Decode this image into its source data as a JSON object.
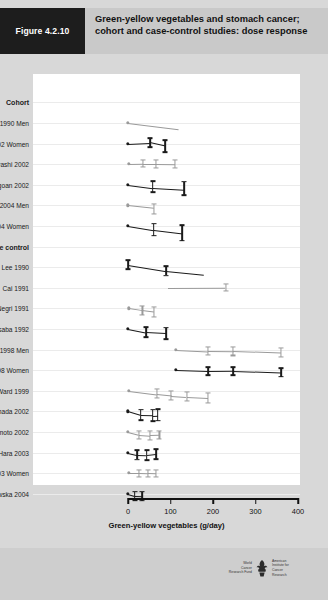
{
  "header": {
    "figure_number": "Figure 4.2.10",
    "title": "Green-yellow vegetables and stomach cancer; cohort and case-control studies: dose response"
  },
  "footer": {
    "logo_left": "World Cancer Research Fund",
    "logo_right": "American Institute for Cancer Research",
    "logo_left_lines": [
      "World",
      "Cancer",
      "Research Fund"
    ],
    "logo_right_lines": [
      "American",
      "Institute for",
      "Cancer Research"
    ]
  },
  "chart_data": {
    "type": "scatter",
    "title": "Green-yellow vegetables and stomach cancer; cohort and case-control studies: dose response",
    "xlabel": "Green-yellow vegetables (g/day)",
    "ylabel": "",
    "xlim": [
      0,
      400
    ],
    "xticks": [
      0,
      100,
      200,
      300,
      400
    ],
    "xtick_labels": [
      "0",
      "100",
      "200",
      "300",
      "400"
    ],
    "grid": true,
    "legend": "none",
    "group_headings": [
      "Cohort",
      "Case control"
    ],
    "colors": {
      "dark": "#1a1a1a",
      "light": "#9a9a9a",
      "grid": "#ebebeb",
      "panel": "#ffffff"
    },
    "rows": [
      {
        "label": "Cohort",
        "heading": true
      },
      {
        "label": "Chyou 1990 Men",
        "color": "light",
        "points": [
          {
            "x": 0,
            "y": 0.0,
            "ref": true
          },
          {
            "x": 118,
            "y": -0.9
          }
        ]
      },
      {
        "label": "Kasum 2002 Women",
        "color": "dark",
        "points": [
          {
            "x": 0,
            "y": 0.0,
            "ref": true
          },
          {
            "x": 52,
            "y": 0.15,
            "lo": -0.5,
            "hi": 0.8
          },
          {
            "x": 88,
            "y": -0.35,
            "lo": -1.2,
            "hi": 0.5
          }
        ]
      },
      {
        "label": "Kobayashi 2002",
        "color": "light",
        "points": [
          {
            "x": 2,
            "y": 0.0,
            "ref": true
          },
          {
            "x": 36,
            "y": 0.05,
            "lo": -0.45,
            "hi": 0.55
          },
          {
            "x": 66,
            "y": 0.05,
            "lo": -0.5,
            "hi": 0.6
          },
          {
            "x": 110,
            "y": 0.0,
            "lo": -0.55,
            "hi": 0.55
          }
        ]
      },
      {
        "label": "Ngoan 2002",
        "color": "dark",
        "points": [
          {
            "x": 0,
            "y": 0.0,
            "ref": true
          },
          {
            "x": 58,
            "y": -0.45,
            "lo": -1.1,
            "hi": 0.55
          },
          {
            "x": 132,
            "y": -0.7,
            "lo": -1.5,
            "hi": 0.45
          }
        ]
      },
      {
        "label": "Khan 2004 Men",
        "color": "light",
        "points": [
          {
            "x": 0,
            "y": 0.0,
            "ref": true
          },
          {
            "x": 62,
            "y": -0.4,
            "lo": -1.3,
            "hi": 0.2
          }
        ]
      },
      {
        "label": "Khan 2004 Women",
        "color": "dark",
        "points": [
          {
            "x": 0,
            "y": 0.0,
            "ref": true
          },
          {
            "x": 60,
            "y": -0.6,
            "lo": -1.4,
            "hi": 0.3
          },
          {
            "x": 128,
            "y": -1.1,
            "lo": -2.1,
            "hi": 0.1
          }
        ]
      },
      {
        "label": "Case control",
        "heading": true
      },
      {
        "label": "Lee 1990",
        "color": "dark",
        "points": [
          {
            "x": 0,
            "y": 0.35,
            "lo": -0.3,
            "hi": 1.0
          },
          {
            "x": 90,
            "y": -0.55,
            "lo": -1.2,
            "hi": 0.1
          },
          {
            "x": 180,
            "y": -1.1
          }
        ]
      },
      {
        "label": "Cai 1991",
        "color": "light",
        "points": [
          {
            "x": 95,
            "y": 0.0
          },
          {
            "x": 230,
            "y": 0.05,
            "lo": -0.45,
            "hi": 0.5
          }
        ]
      },
      {
        "label": "Negri 1991",
        "color": "light",
        "points": [
          {
            "x": 2,
            "y": 0.0,
            "ref": true
          },
          {
            "x": 34,
            "y": -0.3,
            "lo": -0.9,
            "hi": 0.3
          },
          {
            "x": 62,
            "y": -0.5,
            "lo": -1.2,
            "hi": 0.25
          }
        ]
      },
      {
        "label": "Hoshiyama and Sasaba 1992",
        "color": "dark",
        "points": [
          {
            "x": 0,
            "y": 0.0,
            "ref": true
          },
          {
            "x": 42,
            "y": -0.5,
            "lo": -1.2,
            "hi": 0.25
          },
          {
            "x": 90,
            "y": -0.65,
            "lo": -1.5,
            "hi": 0.2
          }
        ]
      },
      {
        "label": "Ji 1998 Men",
        "color": "light",
        "points": [
          {
            "x": 112,
            "y": 0.0,
            "ref": true
          },
          {
            "x": 188,
            "y": -0.2,
            "lo": -0.8,
            "hi": 0.35
          },
          {
            "x": 248,
            "y": -0.25,
            "lo": -0.85,
            "hi": 0.35
          },
          {
            "x": 360,
            "y": -0.45,
            "lo": -1.1,
            "hi": 0.2
          }
        ]
      },
      {
        "label": "Ji 1998 Women",
        "color": "dark",
        "points": [
          {
            "x": 112,
            "y": 0.0,
            "ref": true
          },
          {
            "x": 188,
            "y": -0.15,
            "lo": -0.75,
            "hi": 0.4
          },
          {
            "x": 248,
            "y": -0.1,
            "lo": -0.7,
            "hi": 0.45
          },
          {
            "x": 360,
            "y": -0.3,
            "lo": -0.95,
            "hi": 0.3
          }
        ]
      },
      {
        "label": "Ward 1999",
        "color": "light",
        "points": [
          {
            "x": 2,
            "y": 0.0,
            "ref": true
          },
          {
            "x": 68,
            "y": -0.5,
            "lo": -1.1,
            "hi": 0.2
          },
          {
            "x": 102,
            "y": -0.7,
            "lo": -1.3,
            "hi": -0.1
          },
          {
            "x": 138,
            "y": -0.85,
            "lo": -1.5,
            "hi": -0.2
          },
          {
            "x": 188,
            "y": -1.0,
            "lo": -1.7,
            "hi": -0.3
          }
        ]
      },
      {
        "label": "Hamada 2002",
        "color": "dark",
        "points": [
          {
            "x": 0,
            "y": 0.0,
            "ref": true
          },
          {
            "x": 30,
            "y": -0.55,
            "lo": -1.3,
            "hi": 0.25
          },
          {
            "x": 58,
            "y": -0.6,
            "lo": -1.4,
            "hi": 0.25
          },
          {
            "x": 70,
            "y": -0.55,
            "lo": -1.35,
            "hi": 0.3
          }
        ]
      },
      {
        "label": "Nishimoto 2002",
        "color": "light",
        "points": [
          {
            "x": 0,
            "y": 0.0,
            "ref": true
          },
          {
            "x": 26,
            "y": -0.4,
            "lo": -1.0,
            "hi": 0.2
          },
          {
            "x": 52,
            "y": -0.5,
            "lo": -1.1,
            "hi": 0.15
          },
          {
            "x": 74,
            "y": -0.45,
            "lo": -1.05,
            "hi": 0.2
          }
        ]
      },
      {
        "label": "Hara 2003",
        "color": "dark",
        "points": [
          {
            "x": 0,
            "y": 0.0,
            "ref": true
          },
          {
            "x": 22,
            "y": -0.3,
            "lo": -1.0,
            "hi": 0.35
          },
          {
            "x": 44,
            "y": -0.35,
            "lo": -1.05,
            "hi": 0.3
          },
          {
            "x": 66,
            "y": -0.2,
            "lo": -0.95,
            "hi": 0.45
          }
        ]
      },
      {
        "label": "Ito 2003 Women",
        "color": "light",
        "points": [
          {
            "x": 2,
            "y": 0.0,
            "ref": true
          },
          {
            "x": 26,
            "y": 0.0,
            "lo": -0.5,
            "hi": 0.5
          },
          {
            "x": 48,
            "y": -0.05,
            "lo": -0.55,
            "hi": 0.45
          },
          {
            "x": 66,
            "y": -0.1,
            "lo": -0.6,
            "hi": 0.4
          }
        ]
      },
      {
        "label": "Lissowska 2004",
        "color": "dark",
        "points": [
          {
            "x": 0,
            "y": 0.0,
            "ref": true
          },
          {
            "x": 16,
            "y": -0.3,
            "lo": -0.95,
            "hi": 0.3
          },
          {
            "x": 34,
            "y": -0.35,
            "lo": -1.0,
            "hi": 0.3
          }
        ]
      }
    ]
  }
}
